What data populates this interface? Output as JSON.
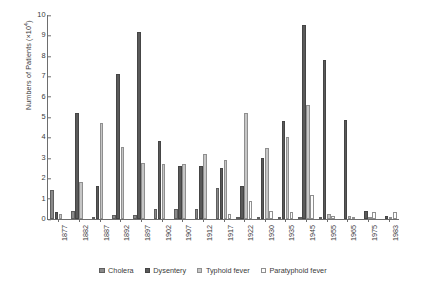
{
  "chart_data": {
    "type": "bar",
    "title": "",
    "xlabel": "",
    "ylabel": "Numbers of Patients (×10⁴)",
    "ylabel_text": "Numbers of Patients (",
    "ylabel_exp": "×10",
    "ylabel_sup": "4",
    "ylabel_close": ")",
    "ylim": [
      0,
      10
    ],
    "yticks": [
      0,
      1,
      2,
      3,
      4,
      5,
      6,
      7,
      8,
      9,
      10
    ],
    "grid": false,
    "legend_position": "bottom",
    "categories": [
      "1877",
      "1882",
      "1887",
      "1892",
      "1897",
      "1902",
      "1907",
      "1912",
      "1917",
      "1922",
      "1930",
      "1935",
      "1945",
      "1955",
      "1965",
      "1975",
      "1983"
    ],
    "series": [
      {
        "name": "Cholera",
        "color": "#8a8a8a",
        "values": [
          1.4,
          0.4,
          0.05,
          0.2,
          0.2,
          0.5,
          0.5,
          0.5,
          1.5,
          0.1,
          0.05,
          0.05,
          0.05,
          0.02,
          0.0,
          0.0,
          0.0
        ]
      },
      {
        "name": "Dysentery",
        "color": "#5a5a5a",
        "values": [
          0.35,
          5.2,
          1.6,
          7.1,
          9.15,
          3.8,
          2.6,
          2.6,
          2.5,
          1.6,
          3.0,
          4.8,
          9.5,
          7.8,
          4.85,
          0.4,
          0.15
        ]
      },
      {
        "name": "Typhoid fever",
        "color": "#c6c6c6",
        "values": [
          0.25,
          1.8,
          4.7,
          3.55,
          2.75,
          2.7,
          2.7,
          3.2,
          2.9,
          5.2,
          3.5,
          4.0,
          5.6,
          0.25,
          0.15,
          0.1,
          0.05
        ]
      },
      {
        "name": "Paratyphoid fever",
        "color": "#fdfdfd",
        "values": [
          0.0,
          0.0,
          0.0,
          0.0,
          0.0,
          0.0,
          0.0,
          0.0,
          0.25,
          0.9,
          0.4,
          0.35,
          1.2,
          0.15,
          0.1,
          0.35,
          0.35
        ]
      }
    ]
  },
  "legend": {
    "items": [
      {
        "label": "Cholera"
      },
      {
        "label": "Dysentery"
      },
      {
        "label": "Typhoid fever"
      },
      {
        "label": "Paratyphoid fever"
      }
    ]
  }
}
